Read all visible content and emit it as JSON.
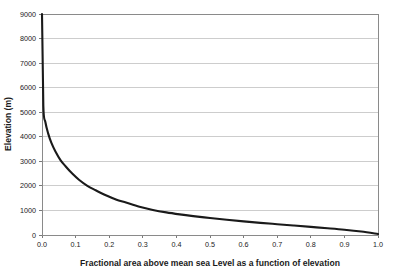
{
  "chart_data": {
    "type": "line",
    "title": "",
    "xlabel": "Fractional area above mean sea Level as a function of elevation",
    "ylabel": "Elevation (m)",
    "xlim": [
      0.0,
      1.0
    ],
    "ylim": [
      0,
      9000
    ],
    "grid": "horizontal",
    "legend": "none",
    "x_ticks": [
      "0.0",
      "0.1",
      "0.2",
      "0.3",
      "0.4",
      "0.5",
      "0.6",
      "0.7",
      "0.8",
      "0.9",
      "1.0"
    ],
    "x_tick_values": [
      0.0,
      0.1,
      0.2,
      0.3,
      0.4,
      0.5,
      0.6,
      0.7,
      0.8,
      0.9,
      1.0
    ],
    "y_ticks": [
      "0",
      "1000",
      "2000",
      "3000",
      "4000",
      "5000",
      "6000",
      "7000",
      "8000",
      "9000"
    ],
    "y_tick_values": [
      0,
      1000,
      2000,
      3000,
      4000,
      5000,
      6000,
      7000,
      8000,
      9000
    ],
    "series": [
      {
        "name": "Hypsometric curve",
        "color": "#1a1a1a",
        "x": [
          0.0,
          0.004,
          0.01,
          0.018,
          0.028,
          0.04,
          0.055,
          0.07,
          0.09,
          0.11,
          0.135,
          0.16,
          0.19,
          0.22,
          0.25,
          0.29,
          0.33,
          0.37,
          0.41,
          0.45,
          0.5,
          0.55,
          0.6,
          0.65,
          0.7,
          0.75,
          0.8,
          0.85,
          0.9,
          0.95,
          1.0
        ],
        "y": [
          9000,
          5250,
          4600,
          4150,
          3750,
          3400,
          3050,
          2800,
          2500,
          2250,
          2000,
          1820,
          1620,
          1450,
          1320,
          1150,
          1020,
          920,
          840,
          770,
          690,
          620,
          555,
          495,
          440,
          385,
          330,
          275,
          215,
          140,
          40
        ]
      }
    ]
  },
  "geometry": {
    "plot_left": 42,
    "plot_right": 378,
    "plot_top": 14,
    "plot_bottom": 235
  }
}
